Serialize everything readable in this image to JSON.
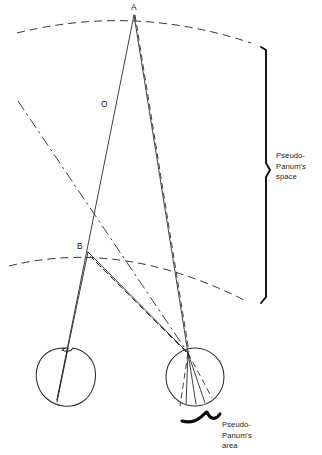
{
  "figure": {
    "type": "optics-diagram",
    "background_color": "#ffffff",
    "line_color": "#2b2b2b"
  },
  "points": [
    {
      "id": "A",
      "label": "A",
      "x": 134,
      "y": 14,
      "label_x": 131,
      "label_y": 10
    },
    {
      "id": "O",
      "label": "O",
      "x": 112,
      "y": 110,
      "label_x": 101,
      "label_y": 106
    },
    {
      "id": "B",
      "label": "B",
      "x": 88,
      "y": 252,
      "label_x": 77,
      "label_y": 248
    }
  ],
  "annotations": {
    "space_brace": {
      "lines": [
        "Pseudo-",
        "Panum's",
        "space"
      ],
      "text_x": 276,
      "text_y_start": 158,
      "line_height": 10.5,
      "brace_top_y": 47,
      "brace_bottom_y": 303,
      "brace_x": 266
    },
    "area_brace": {
      "lines": [
        "Pseudo-",
        "Panum's",
        "area"
      ],
      "text_x": 222,
      "text_y_start": 427,
      "line_height": 10.5,
      "brace_start_x": 182,
      "brace_end_x": 220,
      "brace_y": 419
    }
  },
  "eyes": {
    "left": {
      "cx": 67,
      "cy": 377,
      "r": 29,
      "nodal_x": 67,
      "nodal_y": 348
    },
    "right": {
      "cx": 195,
      "cy": 377,
      "r": 29,
      "nodal_x": 188,
      "nodal_y": 353
    }
  },
  "arcs": {
    "upper": {
      "start_x": 17,
      "start_y": 32,
      "end_x": 250,
      "end_y": 42,
      "peak_y": 14
    },
    "lower": {
      "start_x": 10,
      "start_y": 265,
      "end_x": 245,
      "end_y": 300,
      "peak_y": 249
    }
  },
  "ray_groups": {
    "solid_rays": 4,
    "dashed_rays": 3,
    "dashdot_rays": 1
  }
}
